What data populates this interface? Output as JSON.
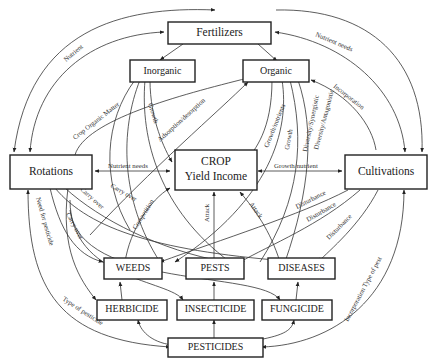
{
  "nodes": {
    "fertilizers": "Fertilizers",
    "inorganic": "Inorganic",
    "organic": "Organic",
    "rotations": "Rotations",
    "crop_line1": "CROP",
    "crop_line2": "Yield Income",
    "cultivations": "Cultivations",
    "weeds": "WEEDS",
    "pests": "PESTS",
    "diseases": "DISEASES",
    "herbicide": "HERBICIDE",
    "insecticide": "INSECTICIDE",
    "fungicide": "FUNGICIDE",
    "pesticides": "PESTICIDES"
  },
  "edge_labels": {
    "nutrient": "Nutrient",
    "nutrient_needs_top": "Nutrient needs",
    "crop_organic_matter": "Crop Organic Matter",
    "growth_inorganic": "Growth",
    "adsorption": "Adsorption/desorption",
    "growth_nutrients": "Growth/nutrients",
    "growth_organic": "Growth",
    "diversity_synergistic": "Diversity/Synergistic",
    "diversity_antagonistic": "Diversity/Antagonistic",
    "incorporation": "Incorporation",
    "nutrient_needs_mid": "Nutrient needs",
    "growth_nutrient": "Growth/nutrient",
    "carry_over_1": "Carry over",
    "carry_over_2": "Carry over",
    "carry_over_3": "Carry over",
    "competition": "Competition",
    "attack_1": "Attack",
    "attack_2": "Attack",
    "disturbance_1": "Disturbance",
    "disturbance_2": "Disturbance",
    "disturbance_3": "Disturbance",
    "need_for_pesticide": "Need for pesticide",
    "type_of_pesticide": "Type of pesticide",
    "incorporation_type_of_pest": "Incorporation Type of pest"
  }
}
